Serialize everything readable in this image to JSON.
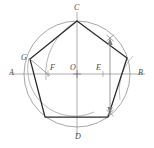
{
  "figure": {
    "type": "geometric-construction-diagram",
    "canvas": {
      "width": 154,
      "height": 148
    },
    "colors": {
      "background": "#ffffff",
      "circle": "#8f8f92",
      "axis": "#8a8a8d",
      "arc": "#9a9a9d",
      "pentagon": "#2b2b2b",
      "arrow": "#7e7e82",
      "label": "#4a4a4a"
    },
    "circle": {
      "cx": 77,
      "cy": 74,
      "r": 53
    },
    "points": {
      "A": {
        "x": 24,
        "y": 74,
        "label": "A",
        "label_x": 9,
        "label_y": 69
      },
      "B": {
        "x": 130,
        "y": 74,
        "label": "B",
        "label_x": 138,
        "label_y": 69
      },
      "C": {
        "x": 77,
        "y": 21,
        "label": "C",
        "label_x": 74,
        "label_y": 4
      },
      "D": {
        "x": 77,
        "y": 127,
        "label": "D",
        "label_x": 75,
        "label_y": 133
      },
      "O": {
        "x": 77,
        "y": 74,
        "label": "O",
        "label_x": 70,
        "label_y": 66
      },
      "E": {
        "x": 103,
        "y": 74,
        "label": "E",
        "label_x": 96,
        "label_y": 66
      },
      "F": {
        "x": 48,
        "y": 74,
        "label": "F",
        "label_x": 50,
        "label_y": 66
      },
      "G": {
        "x": 30,
        "y": 59,
        "label": "G",
        "label_x": 22,
        "label_y": 55
      }
    },
    "pentagon_vertices": [
      {
        "name": "C",
        "x": 77,
        "y": 21
      },
      {
        "name": "V2",
        "x": 127,
        "y": 58
      },
      {
        "name": "V3",
        "x": 108,
        "y": 117
      },
      {
        "name": "V4",
        "x": 45,
        "y": 117
      },
      {
        "name": "G",
        "x": 30,
        "y": 59
      }
    ],
    "arcs": [
      {
        "name": "arc-E-to-F",
        "cx": 103,
        "cy": 74,
        "r": 60,
        "note": "arc centred at E through C meeting AB at F"
      },
      {
        "name": "arc-F-to-upper",
        "cx": 48,
        "cy": 74,
        "r": 47,
        "note": "arc centred at F radius FC"
      }
    ],
    "arrow": {
      "name": "chord-length-arrow",
      "x": 110,
      "y_top": 40,
      "y_bottom": 112,
      "head": "double-up-down",
      "marks": [
        "x-mark-top",
        "x-mark-bottom"
      ]
    },
    "labels": [
      "A",
      "B",
      "C",
      "D",
      "O",
      "E",
      "F",
      "G"
    ]
  }
}
